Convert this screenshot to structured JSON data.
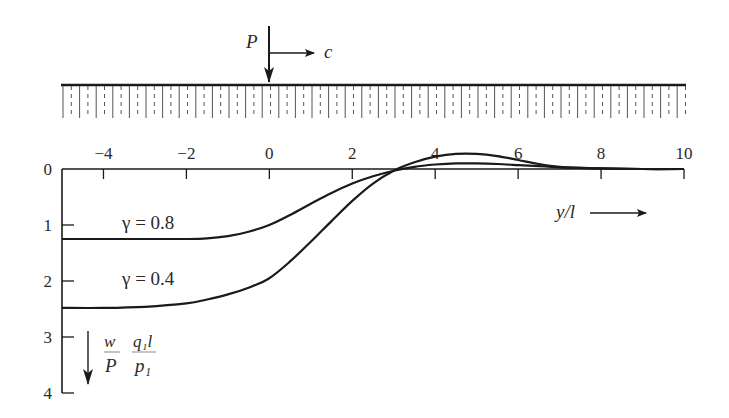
{
  "figure": {
    "load": {
      "label": "P",
      "velocity_label": "c"
    },
    "ground": {
      "hatch_spacing_px": 8.3
    },
    "colors": {
      "ink": "#1a1a1a",
      "background": "#ffffff"
    }
  },
  "chart_data": {
    "type": "line",
    "title": "",
    "xlabel": "y/l",
    "ylabel": "w/P · q1 l / p1",
    "ylabel_parts": {
      "frac1_num": "w",
      "frac1_den": "P",
      "frac2_num": "q₁l",
      "frac2_den": "p₁"
    },
    "xlim": [
      -5,
      10
    ],
    "ylim": [
      0,
      4
    ],
    "y_inverted": true,
    "grid": false,
    "x_ticks": [
      -4,
      -2,
      0,
      2,
      4,
      6,
      8,
      10
    ],
    "x_tick_labels": [
      "−4",
      "−2",
      "0",
      "2",
      "4",
      "6",
      "8",
      "10"
    ],
    "y_ticks": [
      0,
      1,
      2,
      3,
      4
    ],
    "y_tick_labels": [
      "0",
      "1",
      "2",
      "3",
      "4"
    ],
    "series": [
      {
        "name": "γ = 0.8",
        "label": "γ = 0.8",
        "x": [
          -5,
          -4,
          -3,
          -2,
          -1.5,
          -1,
          -0.5,
          0,
          0.5,
          1,
          1.5,
          2,
          2.5,
          3,
          3.5,
          4,
          4.5,
          5,
          5.5,
          6,
          6.5,
          7,
          7.5,
          8,
          9,
          10
        ],
        "values": [
          1.25,
          1.25,
          1.25,
          1.25,
          1.24,
          1.2,
          1.12,
          1.0,
          0.82,
          0.62,
          0.43,
          0.26,
          0.13,
          0.03,
          -0.04,
          -0.08,
          -0.1,
          -0.1,
          -0.09,
          -0.07,
          -0.05,
          -0.03,
          -0.02,
          -0.01,
          0,
          0
        ]
      },
      {
        "name": "γ = 0.4",
        "label": "γ = 0.4",
        "x": [
          -5,
          -4,
          -3,
          -2,
          -1.5,
          -1,
          -0.5,
          0,
          0.5,
          1,
          1.5,
          2,
          2.5,
          3,
          3.5,
          4,
          4.5,
          5,
          5.5,
          6,
          6.5,
          7,
          7.5,
          8,
          9,
          10
        ],
        "values": [
          2.48,
          2.48,
          2.46,
          2.4,
          2.33,
          2.24,
          2.12,
          1.95,
          1.65,
          1.3,
          0.93,
          0.57,
          0.26,
          0.03,
          -0.12,
          -0.22,
          -0.27,
          -0.27,
          -0.23,
          -0.16,
          -0.09,
          -0.04,
          -0.02,
          -0.01,
          0,
          0
        ]
      }
    ],
    "annotations": [
      {
        "text": "γ = 0.8",
        "x": -3.6,
        "y": 1.0
      },
      {
        "text": "γ = 0.4",
        "x": -3.6,
        "y": 1.95
      },
      {
        "text": "y/l →",
        "x": 7.0,
        "y": 0.8
      }
    ]
  },
  "layout": {
    "x0_px": 62,
    "x1_px": 684,
    "y0_px": 169,
    "y_per_unit_px": 56,
    "ground_y_px": 85,
    "ground_bottom_px": 118,
    "load_x_px": 269
  }
}
